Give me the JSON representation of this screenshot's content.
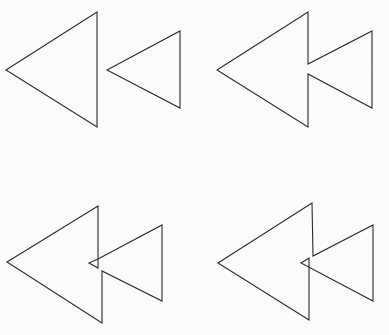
{
  "figure": {
    "stroke_color": "#2b2b2b",
    "background": "#fbfbfb",
    "panels": [
      {
        "id": "separate",
        "label": "Two separate triangles",
        "points_big": "6,70 97,12 97,127",
        "points_small": "107,70 180,31 180,108"
      },
      {
        "id": "joined",
        "label": "Triangles joined at outline",
        "points": "217,70 308,12 308,64 372,31 372,108 308,74 308,127"
      },
      {
        "id": "overlap-notch",
        "label": "Triangles overlapping with notch",
        "points": "7,262 98,206 98,268 89,263 98,259 162,225 162,301 102,271 102,323"
      },
      {
        "id": "overlap-crossed",
        "label": "Triangles overlapping, crossed",
        "points": "218,263 312,203 313,256 373,225 373,301 301,263 309,258 309,320"
      }
    ]
  }
}
